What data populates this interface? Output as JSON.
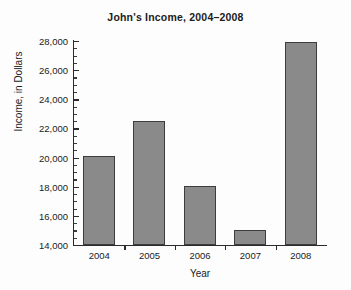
{
  "chart_data": {
    "type": "bar",
    "title": "John's Income, 2004–2008",
    "xlabel": "Year",
    "ylabel": "Income, in Dollars",
    "categories": [
      "2004",
      "2005",
      "2006",
      "2007",
      "2008"
    ],
    "values": [
      20100,
      22500,
      18050,
      15050,
      27900
    ],
    "ylim": [
      14000,
      28000
    ],
    "ytick_labels": [
      "28,000",
      "26,000",
      "24,000",
      "22,000",
      "20,000",
      "18,000",
      "16,000",
      "14,000"
    ],
    "ytick_values": [
      28000,
      26000,
      24000,
      22000,
      20000,
      18000,
      16000,
      14000
    ],
    "ytick_minor_step": 500,
    "grid": false,
    "legend": null,
    "bar_color": "#8a8a8a",
    "bar_edge_color": "#3d3d3d",
    "axis_color": "#2b2b2b",
    "background_color": "#fdfdfd",
    "text_color": "#1b1b1b",
    "series": [
      {
        "name": "Income",
        "values": [
          20100,
          22500,
          18050,
          15050,
          27900
        ]
      }
    ]
  }
}
